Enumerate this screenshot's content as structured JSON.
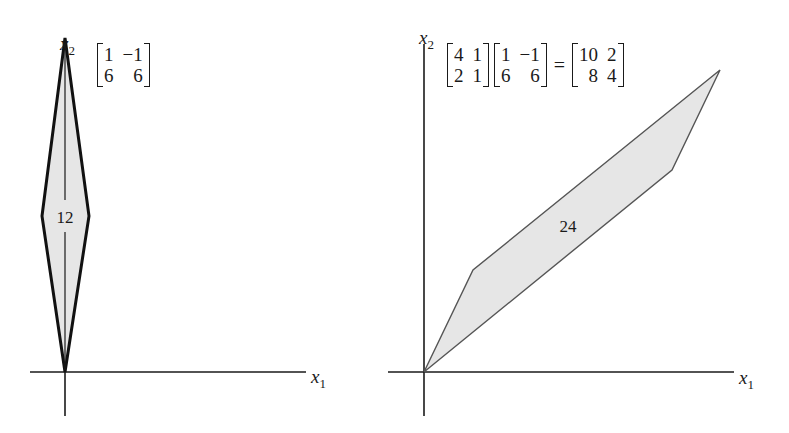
{
  "left_panel": {
    "axis_x_label": "x",
    "axis_x_sub": "1",
    "axis_y_label": "x",
    "axis_y_sub": "2",
    "matrix": [
      [
        "1",
        "−1"
      ],
      [
        "6",
        "6"
      ]
    ],
    "area_label": "12",
    "shape": {
      "vertices": [
        [
          0,
          0
        ],
        [
          1,
          6
        ],
        [
          0,
          12
        ],
        [
          -1,
          6
        ]
      ],
      "fill": "#e6e6e6",
      "stroke": "#111111"
    }
  },
  "right_panel": {
    "axis_x_label": "x",
    "axis_x_sub": "1",
    "axis_y_label": "x",
    "axis_y_sub": "2",
    "equation": {
      "a": [
        [
          "4",
          "1"
        ],
        [
          "2",
          "1"
        ]
      ],
      "b": [
        [
          "1",
          "−1"
        ],
        [
          "6",
          "6"
        ]
      ],
      "equals": "=",
      "result": [
        [
          "10",
          "2"
        ],
        [
          "8",
          "4"
        ]
      ]
    },
    "area_label": "24",
    "shape": {
      "vertices": [
        [
          0,
          0
        ],
        [
          10,
          8
        ],
        [
          12,
          12
        ],
        [
          2,
          4
        ]
      ],
      "fill": "#e6e6e6",
      "stroke": "#555555"
    }
  }
}
